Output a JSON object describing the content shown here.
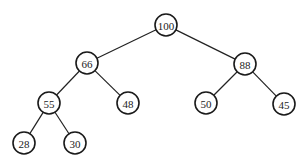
{
  "diagram": {
    "type": "binary-tree",
    "node_radius": 11,
    "colors": {
      "stroke": "#1a1a1a",
      "edge": "#222222",
      "fill": "#ffffff",
      "text": "#222222"
    },
    "nodes": [
      {
        "id": "n100",
        "label": "100",
        "x": 166,
        "y": 25
      },
      {
        "id": "n66",
        "label": "66",
        "x": 87,
        "y": 63
      },
      {
        "id": "n88",
        "label": "88",
        "x": 245,
        "y": 64
      },
      {
        "id": "n55",
        "label": "55",
        "x": 49,
        "y": 103
      },
      {
        "id": "n48",
        "label": "48",
        "x": 128,
        "y": 103
      },
      {
        "id": "n50",
        "label": "50",
        "x": 206,
        "y": 103
      },
      {
        "id": "n45",
        "label": "45",
        "x": 284,
        "y": 104
      },
      {
        "id": "n28",
        "label": "28",
        "x": 24,
        "y": 143
      },
      {
        "id": "n30",
        "label": "30",
        "x": 75,
        "y": 143
      }
    ],
    "edges": [
      {
        "from": "n100",
        "to": "n66"
      },
      {
        "from": "n100",
        "to": "n88"
      },
      {
        "from": "n66",
        "to": "n55"
      },
      {
        "from": "n66",
        "to": "n48"
      },
      {
        "from": "n88",
        "to": "n50"
      },
      {
        "from": "n88",
        "to": "n45"
      },
      {
        "from": "n55",
        "to": "n28"
      },
      {
        "from": "n55",
        "to": "n30"
      }
    ]
  }
}
